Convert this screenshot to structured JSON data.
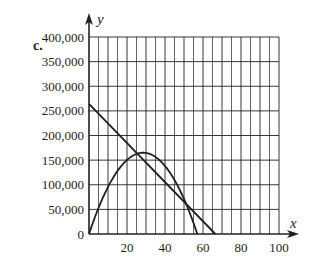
{
  "part_label": "c.",
  "chart_data": {
    "type": "line",
    "title": "",
    "xlabel": "x",
    "ylabel": "y",
    "xlim": [
      0,
      100
    ],
    "ylim": [
      0,
      400000
    ],
    "grid": true,
    "x_grid_step": 5,
    "y_grid_step": 50000,
    "x_ticks": [
      20,
      40,
      60,
      80,
      100
    ],
    "x_tick_labels": [
      "20",
      "40",
      "60",
      "80",
      "100"
    ],
    "y_ticks": [
      0,
      50000,
      100000,
      150000,
      200000,
      250000,
      300000,
      350000,
      400000
    ],
    "y_tick_labels": [
      "0",
      "50,000",
      "100,000",
      "150,000",
      "200,000",
      "250,000",
      "300,000",
      "350,000",
      "400,000"
    ],
    "legend": null,
    "series": [
      {
        "name": "line",
        "kind": "linear",
        "x": [
          0,
          66.5
        ],
        "values": [
          264000,
          0
        ]
      },
      {
        "name": "parabola",
        "kind": "quadratic",
        "x": [
          0,
          5,
          10,
          15,
          20,
          25,
          28.5,
          30,
          35,
          40,
          45,
          50,
          55,
          57
        ],
        "values": [
          0,
          52800,
          95400,
          127800,
          150000,
          162000,
          165000,
          164800,
          156800,
          138000,
          109200,
          71000,
          22600,
          0
        ]
      }
    ],
    "annotations": [
      {
        "text": "intersection",
        "x": 53,
        "y": 54000
      }
    ]
  },
  "colors": {
    "ink": "#231f20",
    "grid": "#231f20",
    "background": "#ffffff"
  }
}
